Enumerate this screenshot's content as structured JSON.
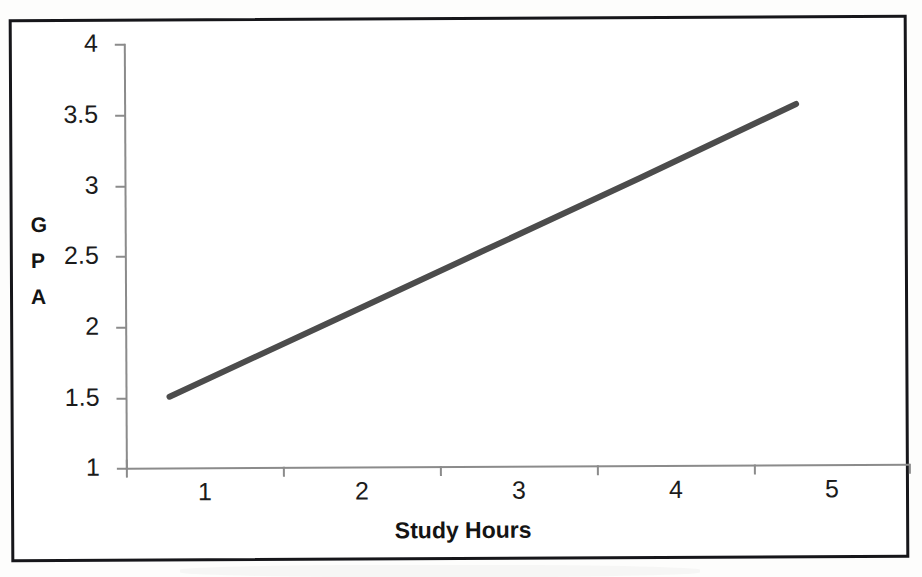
{
  "document": {
    "type": "scanned-page",
    "background_color": "#fdfdfc",
    "frame_color": "#16161a"
  },
  "chart_data": {
    "type": "line",
    "title": "",
    "xlabel": "Study Hours",
    "ylabel": "GPA",
    "ylabel_stacked": [
      "G",
      "P",
      "A"
    ],
    "categories": [
      "1",
      "2",
      "3",
      "4",
      "5"
    ],
    "x": [
      1,
      2,
      3,
      4,
      5
    ],
    "values": [
      1.5,
      2.01,
      2.52,
      3.03,
      3.55
    ],
    "series": [
      {
        "name": "GPA",
        "values": [
          1.5,
          2.01,
          2.52,
          3.03,
          3.55
        ],
        "color": "#4c4c4c",
        "line_width": 6,
        "markers": false
      }
    ],
    "ylim": [
      1,
      4
    ],
    "yticks": [
      1,
      1.5,
      2,
      2.5,
      3,
      3.5,
      4
    ],
    "ytick_labels": [
      "1",
      "1.5",
      "2",
      "2.5",
      "3",
      "3.5",
      "4"
    ],
    "xticks": [
      1,
      2,
      3,
      4,
      5
    ],
    "xtick_labels": [
      "1",
      "2",
      "3",
      "4",
      "5"
    ],
    "grid": false,
    "legend": false,
    "legend_position": "none",
    "axis_color": "#8b8b8b",
    "text_color": "#1b1b1b"
  }
}
